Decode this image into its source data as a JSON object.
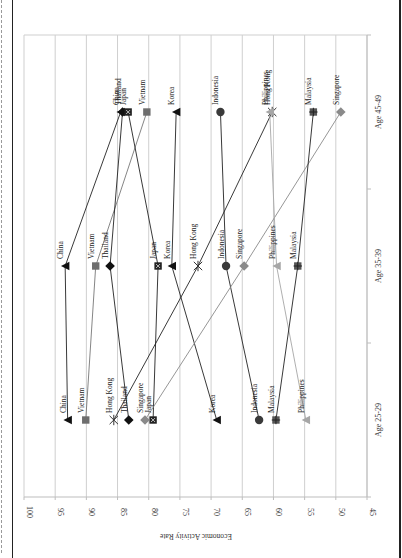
{
  "chart_data": {
    "type": "line",
    "orientation": "rotated-90-clockwise",
    "title": "",
    "xlabel": "",
    "ylabel": "Economic Activity Rate",
    "ylim": [
      45,
      100
    ],
    "yticks": [
      100,
      95,
      90,
      85,
      80,
      75,
      70,
      65,
      60,
      55,
      50,
      45
    ],
    "grid": true,
    "legend": "none (points labeled directly)",
    "categories": [
      "Age 25-29",
      "Age 35-39",
      "Age 45-49"
    ],
    "series": [
      {
        "name": "China",
        "marker": "triangle",
        "color": "#111111",
        "values": [
          93.0,
          93.4,
          84.5
        ]
      },
      {
        "name": "Vietnam",
        "marker": "square",
        "color": "#6e6e6e",
        "values": [
          90.1,
          88.5,
          80.3
        ]
      },
      {
        "name": "Thailand",
        "marker": "diamond",
        "color": "#111111",
        "values": [
          83.2,
          86.2,
          84.2
        ]
      },
      {
        "name": "Japan",
        "marker": "square-x",
        "color": "#333333",
        "values": [
          79.3,
          78.5,
          83.3
        ]
      },
      {
        "name": "Korea",
        "marker": "triangle",
        "color": "#111111",
        "values": [
          69.1,
          76.3,
          75.6
        ]
      },
      {
        "name": "Hong Kong",
        "marker": "star",
        "color": "#333333",
        "values": [
          85.6,
          72.1,
          60.2
        ]
      },
      {
        "name": "Indonesia",
        "marker": "circle",
        "color": "#3a3a3a",
        "values": [
          62.3,
          67.6,
          68.5
        ]
      },
      {
        "name": "Singapore",
        "marker": "diamond",
        "color": "#8a8a8a",
        "values": [
          80.6,
          64.7,
          49.2
        ]
      },
      {
        "name": "Philippines",
        "marker": "triangle",
        "color": "#a6a6a6",
        "values": [
          54.8,
          59.5,
          60.6
        ]
      },
      {
        "name": "Malaysia",
        "marker": "square-plus",
        "color": "#555555",
        "values": [
          59.6,
          56.1,
          53.6
        ]
      }
    ]
  }
}
